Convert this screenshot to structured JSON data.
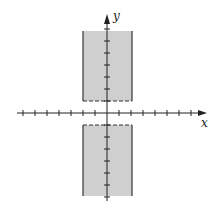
{
  "diagram": {
    "type": "shaded-region-graph",
    "axes": {
      "x_label": "x",
      "y_label": "y",
      "x_ticks_each_side": 7,
      "y_ticks_each_side": 7,
      "tick_spacing_units": 1
    },
    "region": {
      "x_min": -2,
      "x_max": 2,
      "y_inner_boundary": 1,
      "inner_boundary_style": "dashed",
      "outer_boundary_style": "solid",
      "extends_vertically": true
    },
    "colors": {
      "fill": "#cfcfcf",
      "axis": "#222222",
      "boundary": "#333333"
    }
  }
}
